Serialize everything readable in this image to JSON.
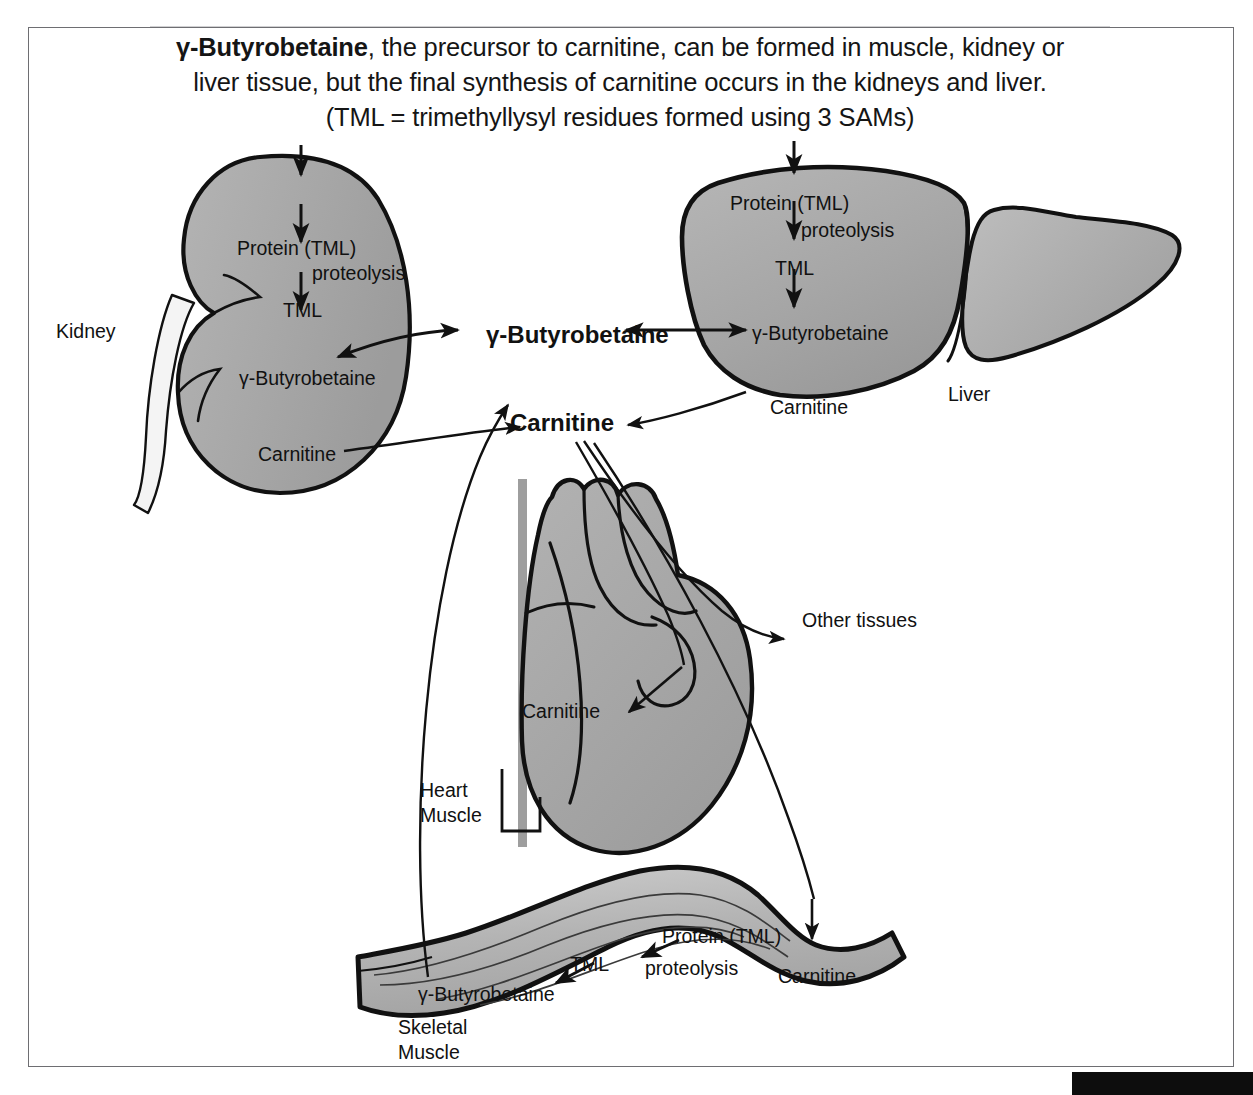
{
  "caption": {
    "line1_lead": "γ-Butyrobetaine",
    "line1_rest": ", the precursor to carnitine, can be formed in muscle, kidney or",
    "line2": "liver tissue, but the final synthesis of carnitine occurs in the kidneys and liver.",
    "line3": "(TML = trimethyllysyl residues formed using 3 SAMs)"
  },
  "colors": {
    "organ_fill": "#a9a9a9",
    "organ_fill_light": "#c9c9c9",
    "organ_outline": "#111111",
    "frame": "#6e6e72",
    "text": "#111111"
  },
  "organs": {
    "kidney": {
      "name": "Kidney",
      "pathway": {
        "protein": "Protein (TML)",
        "proteolysis": "proteolysis",
        "tml": "TML",
        "butyrobetaine": "γ-Butyrobetaine",
        "carnitine": "Carnitine"
      }
    },
    "liver": {
      "name": "Liver",
      "pathway": {
        "protein": "Protein (TML)",
        "proteolysis": "proteolysis",
        "tml": "TML",
        "butyrobetaine": "γ-Butyrobetaine",
        "carnitine": "Carnitine"
      }
    },
    "heart": {
      "name_line1": "Heart",
      "name_line2": "Muscle",
      "carnitine": "Carnitine"
    },
    "skeletal_muscle": {
      "name_line1": "Skeletal",
      "name_line2": "Muscle",
      "pathway": {
        "protein": "Protein (TML)",
        "proteolysis": "proteolysis",
        "tml": "TML",
        "butyrobetaine": "γ-Butyrobetaine",
        "carnitine": "Carnitine"
      }
    }
  },
  "central_pool": {
    "butyrobetaine": "γ-Butyrobetaine",
    "carnitine": "Carnitine"
  },
  "other_tissues": "Other tissues"
}
